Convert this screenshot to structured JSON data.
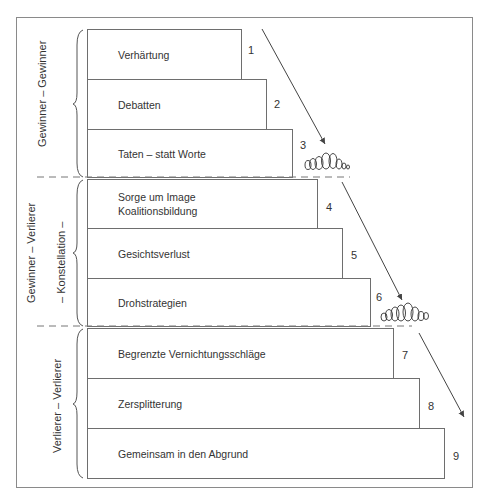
{
  "diagram": {
    "steps": [
      {
        "number": "1",
        "label": "Verhärtung"
      },
      {
        "number": "2",
        "label": "Debatten"
      },
      {
        "number": "3",
        "label": "Taten – statt Worte"
      },
      {
        "number": "4",
        "label": "Sorge um Image\nKoalitionsbildung"
      },
      {
        "number": "5",
        "label": "Gesichtsverlust"
      },
      {
        "number": "6",
        "label": "Drohstrategien"
      },
      {
        "number": "7",
        "label": "Begrenzte Vernichtungsschläge"
      },
      {
        "number": "8",
        "label": "Zersplitterung"
      },
      {
        "number": "9",
        "label": "Gemeinsam in den Abgrund"
      }
    ],
    "groups": [
      {
        "label": "Gewinner – Gewinner",
        "steps": "1-3"
      },
      {
        "label": "Gewinner – Verlierer",
        "sublabel": "– Konstellation –",
        "steps": "4-6"
      },
      {
        "label": "Verlierer – Verlierer",
        "steps": "7-9"
      }
    ],
    "colors": {
      "line": "#6e6e6e",
      "text": "#333333",
      "background": "#ffffff"
    }
  }
}
